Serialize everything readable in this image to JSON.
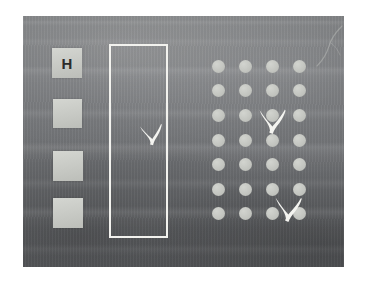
{
  "scene": {
    "kind": "photograph-of-chalkboard",
    "description": "Dark grey chalkboard photographed on a white background",
    "canvas_width": 365,
    "canvas_height": 283,
    "background_color": "#ffffff"
  },
  "board": {
    "name": "chalkboard",
    "left": 23,
    "top": 16,
    "width": 321,
    "height": 251,
    "base_color": "#6f7173",
    "texture": "horizontal chalk smears"
  },
  "left_column": {
    "label": "column of four light squares",
    "square_color": "#c9cbc6",
    "squares": [
      {
        "name": "square-1",
        "left": 29,
        "top": 32,
        "size": 30,
        "glyph": "H",
        "glyph_color": "#2b2b2b"
      },
      {
        "name": "square-2",
        "left": 30,
        "top": 83,
        "size": 29,
        "glyph": "",
        "glyph_color": "#2b2b2b"
      },
      {
        "name": "square-3",
        "left": 30,
        "top": 135,
        "size": 30,
        "glyph": "",
        "glyph_color": "#2b2b2b"
      },
      {
        "name": "square-4",
        "left": 30,
        "top": 182,
        "size": 30,
        "glyph": "",
        "glyph_color": "#2b2b2b"
      }
    ]
  },
  "selection_rect": {
    "name": "white-outlined-rectangle",
    "left": 86,
    "top": 28,
    "width": 59,
    "height": 194,
    "stroke_color": "#f2f2ee",
    "stroke_width": 2
  },
  "dot_grid": {
    "name": "grid-of-light-circles",
    "columns": 4,
    "rows": 7,
    "dot_diameter": 13,
    "dot_color": "#c2c4bf",
    "column_centers_x": [
      9,
      36,
      63,
      90
    ],
    "row_centers_y": [
      8,
      32,
      57,
      82,
      106,
      131,
      155
    ],
    "origin_left": 186,
    "origin_top": 42
  },
  "x_marks": [
    {
      "name": "x-mark-in-rectangle",
      "left": 115,
      "top": 106,
      "size": 26,
      "color": "#f4f4f0",
      "rotation": -4
    },
    {
      "name": "x-mark-upper-grid",
      "left": 233,
      "top": 90,
      "size": 31,
      "color": "#f4f4f0",
      "rotation": 2
    },
    {
      "name": "x-mark-lower-grid",
      "left": 249,
      "top": 178,
      "size": 31,
      "color": "#f4f4f0",
      "rotation": 3
    }
  ],
  "colors": {
    "board": "#6f7173",
    "chalk_white": "#f2f2ee",
    "square_fill": "#c9cbc6",
    "dot_fill": "#c2c4bf",
    "glyph_dark": "#2b2b2b",
    "page_background": "#ffffff"
  }
}
